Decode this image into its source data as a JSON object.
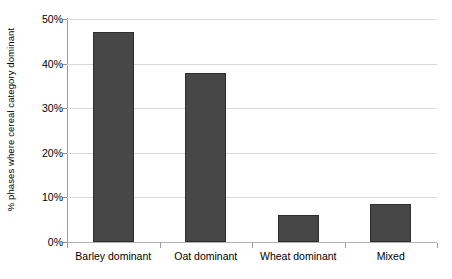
{
  "chart_data": {
    "type": "bar",
    "title": "",
    "xlabel": "",
    "ylabel": "% phases where cereal category dominant",
    "categories": [
      "Barley dominant",
      "Oat dominant",
      "Wheat dominant",
      "Mixed"
    ],
    "values": [
      47,
      38,
      6,
      8.5
    ],
    "ylim": [
      0,
      50
    ],
    "ytick_labels": [
      "0%",
      "10%",
      "20%",
      "30%",
      "40%",
      "50%"
    ],
    "ytick_values": [
      0,
      10,
      20,
      30,
      40,
      50
    ],
    "grid": true,
    "legend": "none",
    "bar_color": "#474747",
    "bar_edge_color": "#2f2f2f",
    "gridline_color": "#d9d9d9",
    "axis_color": "#9a9a9a",
    "background": "#ffffff"
  }
}
